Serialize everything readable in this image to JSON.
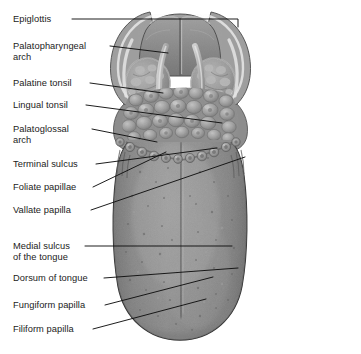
{
  "figure": {
    "background_color": "#ffffff",
    "line_color": "#111111",
    "label_text_color": "#1b1b1b",
    "tongue_body_color": "#8a8a8a",
    "tongue_shadow_color": "#6d6d6d",
    "tongue_highlight_color": "#a3a3a3",
    "tonsil_color": "#9a9a9a",
    "epiglottis_color": "#8f8f8f",
    "outline_color": "#3a3a3a"
  },
  "labels": [
    {
      "id": "epiglottis",
      "text": "Epiglottis",
      "x": 13,
      "y": 14,
      "leader": [
        [
          72,
          19
        ],
        [
          238,
          19
        ],
        [
          238,
          27
        ]
      ]
    },
    {
      "id": "palatopharyngeal",
      "text": "Palatopharyngeal\narch",
      "x": 13,
      "y": 41,
      "leader": [
        [
          110,
          46
        ],
        [
          168,
          53
        ]
      ]
    },
    {
      "id": "palatine-tonsil",
      "text": "Palatine tonsil",
      "x": 13,
      "y": 78,
      "leader": [
        [
          90,
          83
        ],
        [
          163,
          93
        ]
      ]
    },
    {
      "id": "lingual-tonsil",
      "text": "Lingual tonsil",
      "x": 13,
      "y": 100,
      "leader": [
        [
          86,
          105
        ],
        [
          222,
          123
        ]
      ]
    },
    {
      "id": "palatoglossal",
      "text": "Palatoglossal\narch",
      "x": 13,
      "y": 124,
      "leader": [
        [
          92,
          129
        ],
        [
          157,
          142
        ]
      ]
    },
    {
      "id": "terminal-sulcus",
      "text": "Terminal sulcus",
      "x": 13,
      "y": 159,
      "leader": [
        [
          96,
          164
        ],
        [
          217,
          148
        ]
      ]
    },
    {
      "id": "foliate-papillae",
      "text": "Foliate papillae",
      "x": 13,
      "y": 182,
      "leader": [
        [
          93,
          187
        ],
        [
          166,
          152
        ]
      ]
    },
    {
      "id": "vallate-papilla",
      "text": "Vallate papilla",
      "x": 13,
      "y": 205,
      "leader": [
        [
          91,
          210
        ],
        [
          245,
          157
        ]
      ]
    },
    {
      "id": "medial-sulcus",
      "text": "Medial sulcus\nof the tongue",
      "x": 13,
      "y": 241,
      "leader": [
        [
          85,
          246
        ],
        [
          232,
          246
        ]
      ]
    },
    {
      "id": "dorsum-of-tongue",
      "text": "Dorsum of tongue",
      "x": 13,
      "y": 273,
      "leader": [
        [
          104,
          278
        ],
        [
          238,
          268
        ]
      ]
    },
    {
      "id": "fungiform-papilla",
      "text": "Fungiform papilla",
      "x": 13,
      "y": 300,
      "leader": [
        [
          105,
          305
        ],
        [
          213,
          277
        ]
      ]
    },
    {
      "id": "filiform-papilla",
      "text": "Filiform papilla",
      "x": 13,
      "y": 324,
      "leader": [
        [
          93,
          329
        ],
        [
          206,
          299
        ]
      ]
    }
  ],
  "anatomy_notes": {
    "epiglottis": "Leaf-shaped cartilage flap at the top midline with a central notch",
    "palatine_tonsil": "Paired oval lymphoid masses in the lateral tonsillar fossae",
    "lingual_tonsil": "Cobblestone-like cluster of lymphoid nodules on the posterior tongue",
    "vallate_papillae": "Row of ring-shaped papillae forming a V along the terminal sulcus",
    "terminal_sulcus": "V-shaped groove dividing the anterior two thirds from the posterior third",
    "medial_sulcus": "Shallow midline groove running the length of the tongue dorsum",
    "tongue_tip": "Rounded apex at the bottom of the illustration"
  }
}
